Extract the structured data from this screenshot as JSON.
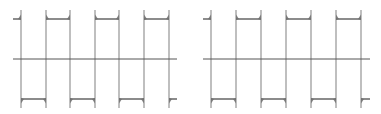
{
  "figure": {
    "width": 381,
    "height": 114,
    "background": "#ffffff",
    "axis_color": "#555555",
    "wave_color": "#8a8a8a",
    "plateau_color": "#6f6f6f"
  },
  "chart_data": [
    {
      "type": "line",
      "title": "",
      "xlabel": "",
      "ylabel": "",
      "description": "Square wave approximated by truncated Fourier series (Gibbs overshoot at each transition)",
      "grid": false,
      "legend": null,
      "axis": {
        "x_start": 13,
        "x_end": 177,
        "y": 59
      },
      "levels": {
        "high": 1,
        "low": -1,
        "overshoot": 1.18
      },
      "pixel_levels": {
        "high": 19,
        "low": 99,
        "spike_top": 10,
        "spike_bottom": 108
      },
      "transitions_px": [
        21,
        46,
        70,
        95,
        119,
        144,
        169
      ],
      "start_level": "high",
      "segments": [
        {
          "x": [
            13,
            21
          ],
          "level": 1
        },
        {
          "x": [
            21,
            46
          ],
          "level": -1
        },
        {
          "x": [
            46,
            70
          ],
          "level": 1
        },
        {
          "x": [
            70,
            95
          ],
          "level": -1
        },
        {
          "x": [
            95,
            119
          ],
          "level": 1
        },
        {
          "x": [
            119,
            144
          ],
          "level": -1
        },
        {
          "x": [
            144,
            169
          ],
          "level": 1
        },
        {
          "x": [
            169,
            177
          ],
          "level": -1
        }
      ]
    },
    {
      "type": "line",
      "title": "",
      "xlabel": "",
      "ylabel": "",
      "description": "Square wave approximated by truncated Fourier series (sharper transitions)",
      "grid": false,
      "legend": null,
      "axis": {
        "x_start": 203,
        "x_end": 370,
        "y": 59
      },
      "levels": {
        "high": 1,
        "low": -1,
        "overshoot": 1.12
      },
      "pixel_levels": {
        "high": 19,
        "low": 99,
        "spike_top": 10,
        "spike_bottom": 108
      },
      "transitions_px": [
        211,
        236,
        261,
        286,
        311,
        336,
        361
      ],
      "start_level": "high",
      "segments": [
        {
          "x": [
            203,
            211
          ],
          "level": 1
        },
        {
          "x": [
            211,
            236
          ],
          "level": -1
        },
        {
          "x": [
            236,
            261
          ],
          "level": 1
        },
        {
          "x": [
            261,
            286
          ],
          "level": -1
        },
        {
          "x": [
            286,
            311
          ],
          "level": 1
        },
        {
          "x": [
            311,
            336
          ],
          "level": -1
        },
        {
          "x": [
            336,
            361
          ],
          "level": 1
        },
        {
          "x": [
            361,
            370
          ],
          "level": -1
        }
      ]
    }
  ]
}
